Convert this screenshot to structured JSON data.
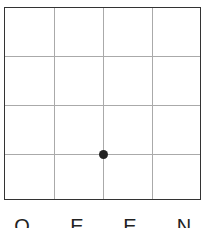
{
  "board": {
    "rows": 4,
    "cols": 4,
    "grid_color": "#aaaaaa",
    "border_color": "#333333",
    "stones": [
      {
        "col": 2,
        "row": 3,
        "color": "#222222"
      }
    ]
  },
  "column_labels": [
    "O",
    "E",
    "E",
    "N"
  ]
}
